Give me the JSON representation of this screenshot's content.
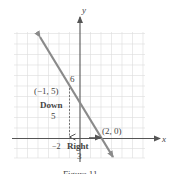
{
  "figure": {
    "axes": {
      "x_label": "x",
      "y_label": "y"
    },
    "points": [
      {
        "label": "(−1, 5)",
        "x": -1,
        "y": 5
      },
      {
        "label": "(2, 0)",
        "x": 2,
        "y": 0
      }
    ],
    "annotations": {
      "down_word": "Down",
      "down_value": "5",
      "right_word": "Right",
      "right_value": "3",
      "y_tick": "6",
      "x_tick": "−2"
    },
    "caption": "Figure 11",
    "colors": {
      "line": "#8a8a8a",
      "axis": "#555555",
      "grid": "#d9d9d9"
    }
  }
}
